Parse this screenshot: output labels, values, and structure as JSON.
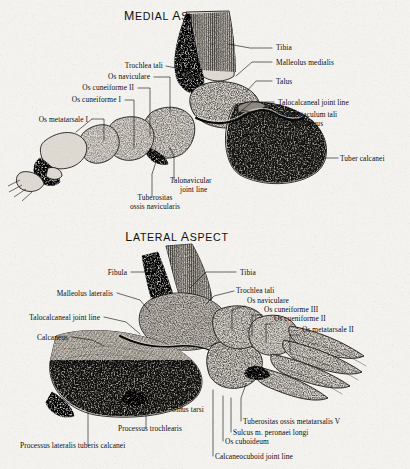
{
  "plate": {
    "background_color": "#f3f2ef",
    "ink_color": "#0d0d0d"
  },
  "figures": [
    {
      "id": "medial",
      "title": "Medial Aspect",
      "labels": [
        {
          "name": "tibia",
          "text": "Tibia",
          "x": 276,
          "y": 50,
          "align": "start"
        },
        {
          "name": "malleolus-medialis",
          "text": "Malleolus medialis",
          "x": 276,
          "y": 65,
          "align": "start"
        },
        {
          "name": "talus",
          "text": "Talus",
          "x": 276,
          "y": 84,
          "align": "start"
        },
        {
          "name": "talocalcaneal-joint-line",
          "text": "Talocalcaneal joint line",
          "x": 278,
          "y": 105,
          "align": "start"
        },
        {
          "name": "sustentaculum-tali",
          "text": "Sustentaculum tali",
          "x": 281,
          "y": 117,
          "align": "start"
        },
        {
          "name": "calcaneus",
          "text": "Calcaneus",
          "x": 292,
          "y": 126,
          "align": "start"
        },
        {
          "name": "tuber-calcanei",
          "text": "Tuber calcanei",
          "x": 340,
          "y": 161,
          "align": "start"
        },
        {
          "name": "trochlea-tali",
          "text": "Trochlea tali",
          "x": 163,
          "y": 68,
          "align": "end"
        },
        {
          "name": "os-naviculare",
          "text": "Os naviculare",
          "x": 150,
          "y": 79,
          "align": "end"
        },
        {
          "name": "os-cuneiforme-ii",
          "text": "Os cuneiforme II",
          "x": 134,
          "y": 90,
          "align": "end"
        },
        {
          "name": "os-cuneiforme-i",
          "text": "Os cuneiforme I",
          "x": 121,
          "y": 102,
          "align": "end"
        },
        {
          "name": "os-metatarsale-i",
          "text": "Os metatarsale I",
          "x": 88,
          "y": 122,
          "align": "end"
        },
        {
          "name": "talonavicular-joint-line-1",
          "text": "Talonavicular",
          "x": 170,
          "y": 183,
          "align": "start"
        },
        {
          "name": "talonavicular-joint-line-2",
          "text": "joint line",
          "x": 180,
          "y": 192,
          "align": "start"
        },
        {
          "name": "tuberositas-ossis-navicularis-1",
          "text": "Tuberositas",
          "x": 155,
          "y": 200,
          "align": "middle"
        },
        {
          "name": "tuberositas-ossis-navicularis-2",
          "text": "ossis navicularis",
          "x": 155,
          "y": 209,
          "align": "middle"
        }
      ]
    },
    {
      "id": "lateral",
      "title": "Lateral Aspect",
      "labels": [
        {
          "name": "fibula",
          "text": "Fibula",
          "x": 127,
          "y": 275,
          "align": "end"
        },
        {
          "name": "malleolus-lateralis",
          "text": "Malleolus lateralis",
          "x": 113,
          "y": 296,
          "align": "end"
        },
        {
          "name": "talocalcaneal-joint-line",
          "text": "Talocalcaneal joint line",
          "x": 100,
          "y": 320,
          "align": "end"
        },
        {
          "name": "calcaneus",
          "text": "Calcaneus",
          "x": 68,
          "y": 340,
          "align": "end"
        },
        {
          "name": "tibia",
          "text": "Tibia",
          "x": 240,
          "y": 275,
          "align": "start"
        },
        {
          "name": "trochlea-tali",
          "text": "Trochlea tali",
          "x": 236,
          "y": 293,
          "align": "start"
        },
        {
          "name": "os-naviculare",
          "text": "Os naviculare",
          "x": 247,
          "y": 303,
          "align": "start"
        },
        {
          "name": "os-cuneiforme-iii",
          "text": "Os cuneiforme III",
          "x": 264,
          "y": 312,
          "align": "start"
        },
        {
          "name": "os-cueniforme-ii",
          "text": "Os cueniforme II",
          "x": 274,
          "y": 321,
          "align": "start"
        },
        {
          "name": "os-metatarsale-ii",
          "text": "Os metatarsale II",
          "x": 302,
          "y": 332,
          "align": "start"
        },
        {
          "name": "sinus-tarsi",
          "text": "Sinus tarsi",
          "x": 172,
          "y": 412,
          "align": "start"
        },
        {
          "name": "processus-trochlearis",
          "text": "Processus trochlearis",
          "x": 118,
          "y": 431,
          "align": "start"
        },
        {
          "name": "processus-lateralis-tuberis-calcanei",
          "text": "Processus lateralis tuberis calcanei",
          "x": 20,
          "y": 448,
          "align": "start"
        },
        {
          "name": "tuberositas-ossis-metatarsalis-v",
          "text": "Tuberositas ossis metatarsalis V",
          "x": 243,
          "y": 424,
          "align": "start"
        },
        {
          "name": "sulcus-m-peronaei-longi",
          "text": "Sulcus m. peronaei longi",
          "x": 233,
          "y": 435,
          "align": "start"
        },
        {
          "name": "os-cuboideum",
          "text": "Os cuboideum",
          "x": 225,
          "y": 444,
          "align": "start"
        },
        {
          "name": "calcaneocuboid-joint-line",
          "text": "Calcaneocuboid joint line",
          "x": 215,
          "y": 459,
          "align": "start"
        }
      ]
    }
  ]
}
